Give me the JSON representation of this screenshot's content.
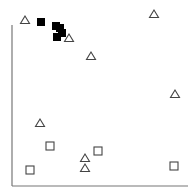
{
  "chart_data": {
    "type": "scatter",
    "title": "",
    "xlabel": "",
    "ylabel": "",
    "grid": false,
    "legend": null,
    "axes": {
      "x_axis": {
        "x1": 12,
        "x2": 188,
        "y": 186
      },
      "y_axis": {
        "x": 12,
        "y1": 25,
        "y2": 186
      }
    },
    "series": [
      {
        "name": "open-triangle",
        "marker": "triangle-open",
        "color": "#444444",
        "points": [
          [
            25,
            20
          ],
          [
            69,
            38
          ],
          [
            91,
            56
          ],
          [
            154,
            14
          ],
          [
            175,
            94
          ],
          [
            40,
            123
          ],
          [
            85,
            158
          ],
          [
            85,
            168
          ]
        ]
      },
      {
        "name": "open-square",
        "marker": "square-open",
        "color": "#444444",
        "points": [
          [
            50,
            146
          ],
          [
            98,
            151
          ],
          [
            174,
            166
          ],
          [
            30,
            170
          ]
        ]
      },
      {
        "name": "filled-square",
        "marker": "square-filled",
        "color": "#000000",
        "points": [
          [
            41,
            22
          ],
          [
            56,
            26
          ],
          [
            60,
            28
          ],
          [
            62,
            33
          ],
          [
            57,
            37
          ]
        ]
      }
    ]
  }
}
